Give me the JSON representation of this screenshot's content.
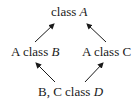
{
  "diagram": {
    "type": "class-inheritance-graph",
    "nodes": [
      {
        "id": "A",
        "prefix": "",
        "keyword": "class",
        "name": "A",
        "name_italic": true
      },
      {
        "id": "B",
        "prefix": "A",
        "keyword": "class",
        "name": "B",
        "name_italic": true
      },
      {
        "id": "C",
        "prefix": "A",
        "keyword": "class",
        "name": "C",
        "name_italic": false
      },
      {
        "id": "D",
        "prefix": "B, C",
        "keyword": "class",
        "name": "D",
        "name_italic": true
      }
    ],
    "edges": [
      {
        "from": "B",
        "to": "A"
      },
      {
        "from": "C",
        "to": "A"
      },
      {
        "from": "D",
        "to": "B"
      },
      {
        "from": "D",
        "to": "C"
      }
    ],
    "colors": {
      "line": "#1a1a1a",
      "background": "#ffffff"
    }
  }
}
